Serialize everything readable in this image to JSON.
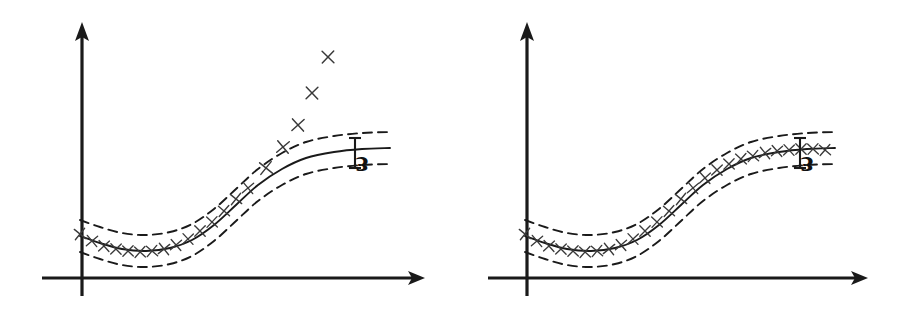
{
  "figure": {
    "background_color": "#ffffff",
    "ink_color": "#1a1a1a",
    "marker_color": "#3a3a3a",
    "width": 903,
    "height": 316
  },
  "chart_data": {
    "type": "line",
    "title": "",
    "subtitle": "",
    "xlabel": "",
    "ylabel": "",
    "grid": false,
    "legend": null,
    "axis_style": "arrow-headed hand-drawn axes, no tick labels",
    "xlim": [
      0,
      360
    ],
    "ylim": [
      0,
      260
    ],
    "panels": [
      {
        "id": "left",
        "name": "with-outliers",
        "origin_px": {
          "x": 82,
          "y": 278
        },
        "x_axis": {
          "start_px": 42,
          "end_px": 425,
          "y_px": 278,
          "arrow": "right"
        },
        "y_axis": {
          "x_px": 82,
          "start_px": 296,
          "end_px": 22,
          "arrow": "up"
        },
        "series": [
          {
            "name": "regression curve",
            "style": "solid",
            "points": [
              [
                80,
                236
              ],
              [
                100,
                243
              ],
              [
                122,
                249
              ],
              [
                146,
                251
              ],
              [
                170,
                248
              ],
              [
                192,
                240
              ],
              [
                214,
                225
              ],
              [
                236,
                205
              ],
              [
                258,
                185
              ],
              [
                282,
                169
              ],
              [
                306,
                158
              ],
              [
                334,
                152
              ],
              [
                362,
                149
              ],
              [
                390,
                148
              ]
            ]
          },
          {
            "name": "upper tube edge (+epsilon)",
            "style": "dashed",
            "offset_px": -16,
            "points": [
              [
                80,
                220
              ],
              [
                100,
                227
              ],
              [
                122,
                233
              ],
              [
                146,
                235
              ],
              [
                170,
                232
              ],
              [
                192,
                224
              ],
              [
                214,
                209
              ],
              [
                236,
                189
              ],
              [
                258,
                169
              ],
              [
                282,
                153
              ],
              [
                306,
                142
              ],
              [
                334,
                136
              ],
              [
                362,
                133
              ],
              [
                390,
                132
              ]
            ]
          },
          {
            "name": "lower tube edge (-epsilon)",
            "style": "dashed",
            "offset_px": 16,
            "points": [
              [
                80,
                252
              ],
              [
                100,
                259
              ],
              [
                122,
                265
              ],
              [
                146,
                267
              ],
              [
                170,
                264
              ],
              [
                192,
                256
              ],
              [
                214,
                241
              ],
              [
                236,
                221
              ],
              [
                258,
                201
              ],
              [
                282,
                185
              ],
              [
                306,
                174
              ],
              [
                334,
                168
              ],
              [
                362,
                165
              ],
              [
                390,
                164
              ]
            ]
          }
        ],
        "inlier_points": [
          [
            80,
            234
          ],
          [
            92,
            241
          ],
          [
            104,
            246
          ],
          [
            116,
            249
          ],
          [
            128,
            251
          ],
          [
            140,
            252
          ],
          [
            152,
            251
          ],
          [
            164,
            249
          ],
          [
            176,
            245
          ],
          [
            188,
            239
          ],
          [
            200,
            231
          ],
          [
            212,
            222
          ],
          [
            224,
            211
          ],
          [
            236,
            199
          ],
          [
            248,
            188
          ]
        ],
        "outlier_points": [
          [
            266,
            168
          ],
          [
            283,
            147
          ],
          [
            298,
            125
          ],
          [
            312,
            93
          ],
          [
            328,
            57
          ]
        ],
        "epsilon_marker": {
          "label": "ɛ",
          "bar_x_px": 355,
          "bar_top_px": 138,
          "bar_bottom_px": 168,
          "cap_half_width_px": 6,
          "label_x_px": 362,
          "label_y_px": 175,
          "label_rotation_deg": 180
        }
      },
      {
        "id": "right",
        "name": "all-points-inside-tube",
        "origin_px": {
          "x": 527,
          "y": 278
        },
        "x_axis": {
          "start_px": 488,
          "end_px": 868,
          "y_px": 278,
          "arrow": "right"
        },
        "y_axis": {
          "x_px": 527,
          "start_px": 296,
          "end_px": 22,
          "arrow": "up"
        },
        "series": [
          {
            "name": "regression curve",
            "style": "solid",
            "points": [
              [
                525,
                236
              ],
              [
                545,
                243
              ],
              [
                567,
                249
              ],
              [
                591,
                251
              ],
              [
                615,
                248
              ],
              [
                637,
                240
              ],
              [
                659,
                225
              ],
              [
                681,
                205
              ],
              [
                703,
                185
              ],
              [
                727,
                169
              ],
              [
                751,
                158
              ],
              [
                779,
                152
              ],
              [
                807,
                149
              ],
              [
                835,
                148
              ]
            ]
          },
          {
            "name": "upper tube edge (+epsilon)",
            "style": "dashed",
            "offset_px": -16,
            "points": [
              [
                525,
                220
              ],
              [
                545,
                227
              ],
              [
                567,
                233
              ],
              [
                591,
                235
              ],
              [
                615,
                232
              ],
              [
                637,
                224
              ],
              [
                659,
                209
              ],
              [
                681,
                189
              ],
              [
                703,
                169
              ],
              [
                727,
                153
              ],
              [
                751,
                142
              ],
              [
                779,
                136
              ],
              [
                807,
                133
              ],
              [
                835,
                132
              ]
            ]
          },
          {
            "name": "lower tube edge (-epsilon)",
            "style": "dashed",
            "offset_px": 16,
            "points": [
              [
                525,
                252
              ],
              [
                545,
                259
              ],
              [
                567,
                265
              ],
              [
                591,
                267
              ],
              [
                615,
                264
              ],
              [
                637,
                256
              ],
              [
                659,
                241
              ],
              [
                681,
                221
              ],
              [
                703,
                201
              ],
              [
                727,
                185
              ],
              [
                751,
                174
              ],
              [
                779,
                168
              ],
              [
                807,
                165
              ],
              [
                835,
                164
              ]
            ]
          }
        ],
        "inlier_points": [
          [
            525,
            234
          ],
          [
            537,
            241
          ],
          [
            549,
            246
          ],
          [
            561,
            249
          ],
          [
            573,
            251
          ],
          [
            585,
            252
          ],
          [
            597,
            251
          ],
          [
            609,
            249
          ],
          [
            621,
            245
          ],
          [
            633,
            239
          ],
          [
            645,
            231
          ],
          [
            657,
            222
          ],
          [
            669,
            211
          ],
          [
            681,
            199
          ],
          [
            693,
            188
          ],
          [
            705,
            178
          ],
          [
            717,
            170
          ],
          [
            729,
            164
          ],
          [
            741,
            159
          ],
          [
            753,
            156
          ],
          [
            765,
            153
          ],
          [
            777,
            151
          ],
          [
            789,
            150
          ],
          [
            801,
            149
          ],
          [
            813,
            149
          ],
          [
            825,
            150
          ]
        ],
        "outlier_points": [],
        "epsilon_marker": {
          "label": "ɛ",
          "bar_x_px": 800,
          "bar_top_px": 138,
          "bar_bottom_px": 168,
          "cap_half_width_px": 6,
          "label_x_px": 807,
          "label_y_px": 175,
          "label_rotation_deg": 180
        }
      }
    ],
    "annotations": [
      {
        "text": "ɛ",
        "panel": "left",
        "meaning": "epsilon tube half-width"
      },
      {
        "text": "ɛ",
        "panel": "right",
        "meaning": "epsilon tube half-width"
      }
    ]
  }
}
